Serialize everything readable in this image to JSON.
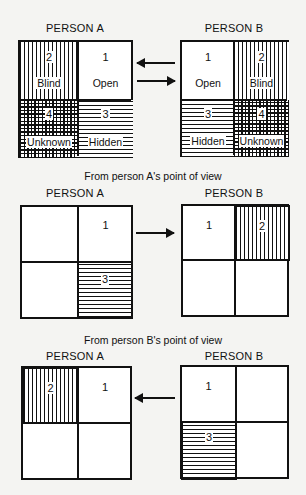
{
  "top": {
    "person_a": "PERSON A",
    "person_b": "PERSON B",
    "grid_a": {
      "q1": {
        "num": "1",
        "label": "Open"
      },
      "q2": {
        "num": "2",
        "label": "Blind"
      },
      "q3": {
        "num": "3",
        "label": "Hidden"
      },
      "q4": {
        "num": "4",
        "label": "Unknown"
      }
    },
    "grid_b": {
      "q1": {
        "num": "1",
        "label": "Open"
      },
      "q2": {
        "num": "2",
        "label": "Blind"
      },
      "q3": {
        "num": "3",
        "label": "Hidden"
      },
      "q4": {
        "num": "4",
        "label": "Unknown"
      }
    }
  },
  "middle": {
    "caption": "From person A's point of view",
    "person_a": "PERSON A",
    "person_b": "PERSON B",
    "grid_a": {
      "q1": "1",
      "q3": "3"
    },
    "grid_b": {
      "q1": "1",
      "q2": "2"
    }
  },
  "bottom": {
    "caption": "From person B's point of view",
    "person_a": "PERSON A",
    "person_b": "PERSON B",
    "grid_a": {
      "q1": "1",
      "q2": "2"
    },
    "grid_b": {
      "q1": "1",
      "q3": "3"
    }
  }
}
